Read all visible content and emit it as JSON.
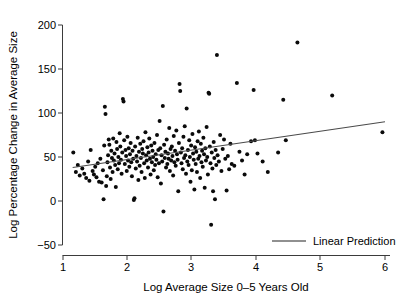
{
  "chart_data": {
    "type": "scatter",
    "title": "",
    "xlabel": "Log Average Size 0–5 Years Old",
    "ylabel": "Log Percentage Change in Average Size",
    "xlim": [
      1.0,
      6.0
    ],
    "ylim": [
      -50,
      200
    ],
    "xticks": [
      1,
      2,
      3,
      4,
      5,
      6
    ],
    "xticklabels": [
      "1",
      "2",
      "3",
      "4",
      "5",
      "6"
    ],
    "yticks": [
      -50,
      0,
      50,
      100,
      150,
      200
    ],
    "yticklabels": [
      "−50",
      "0",
      "50",
      "100",
      "150",
      "200"
    ],
    "grid": false,
    "legend": {
      "position": "bottom-right",
      "entries": [
        {
          "label": "Linear Prediction",
          "type": "line",
          "color": "#6b6b6b"
        }
      ]
    },
    "series": [
      {
        "name": "Observations",
        "type": "scatter",
        "marker": "filled-circle",
        "color": "#0a0a0a",
        "points": [
          [
            1.16,
            55
          ],
          [
            1.2,
            33
          ],
          [
            1.23,
            41
          ],
          [
            1.26,
            29
          ],
          [
            1.3,
            37
          ],
          [
            1.33,
            31
          ],
          [
            1.36,
            26
          ],
          [
            1.39,
            45
          ],
          [
            1.41,
            23
          ],
          [
            1.43,
            58
          ],
          [
            1.46,
            34
          ],
          [
            1.48,
            30
          ],
          [
            1.5,
            39
          ],
          [
            1.52,
            27
          ],
          [
            1.54,
            43
          ],
          [
            1.56,
            22
          ],
          [
            1.58,
            48
          ],
          [
            1.6,
            21
          ],
          [
            1.62,
            35
          ],
          [
            1.63,
            2
          ],
          [
            1.64,
            63
          ],
          [
            1.65,
            107
          ],
          [
            1.66,
            99
          ],
          [
            1.67,
            17
          ],
          [
            1.68,
            28
          ],
          [
            1.69,
            44
          ],
          [
            1.7,
            52
          ],
          [
            1.71,
            70
          ],
          [
            1.72,
            64
          ],
          [
            1.73,
            38
          ],
          [
            1.74,
            25
          ],
          [
            1.75,
            57
          ],
          [
            1.76,
            49
          ],
          [
            1.77,
            33
          ],
          [
            1.78,
            71
          ],
          [
            1.79,
            46
          ],
          [
            1.8,
            54
          ],
          [
            1.81,
            41
          ],
          [
            1.82,
            16
          ],
          [
            1.83,
            67
          ],
          [
            1.84,
            59
          ],
          [
            1.85,
            36
          ],
          [
            1.86,
            50
          ],
          [
            1.87,
            43
          ],
          [
            1.88,
            77
          ],
          [
            1.89,
            62
          ],
          [
            1.9,
            47
          ],
          [
            1.91,
            31
          ],
          [
            1.92,
            55
          ],
          [
            1.93,
            116
          ],
          [
            1.94,
            113
          ],
          [
            1.95,
            69
          ],
          [
            1.96,
            42
          ],
          [
            1.97,
            58
          ],
          [
            1.98,
            51
          ],
          [
            1.99,
            34
          ],
          [
            2.0,
            73
          ],
          [
            2.01,
            46
          ],
          [
            2.02,
            60
          ],
          [
            2.03,
            39
          ],
          [
            2.04,
            53
          ],
          [
            2.05,
            66
          ],
          [
            2.06,
            44
          ],
          [
            2.07,
            28
          ],
          [
            2.08,
            57
          ],
          [
            2.09,
            48
          ],
          [
            2.1,
            1
          ],
          [
            2.11,
            3
          ],
          [
            2.12,
            62
          ],
          [
            2.13,
            37
          ],
          [
            2.14,
            51
          ],
          [
            2.15,
            45
          ],
          [
            2.16,
            72
          ],
          [
            2.17,
            24
          ],
          [
            2.18,
            56
          ],
          [
            2.19,
            40
          ],
          [
            2.2,
            65
          ],
          [
            2.21,
            49
          ],
          [
            2.22,
            33
          ],
          [
            2.23,
            59
          ],
          [
            2.24,
            54
          ],
          [
            2.25,
            68
          ],
          [
            2.26,
            43
          ],
          [
            2.27,
            26
          ],
          [
            2.28,
            78
          ],
          [
            2.29,
            52
          ],
          [
            2.3,
            46
          ],
          [
            2.31,
            61
          ],
          [
            2.32,
            38
          ],
          [
            2.33,
            55
          ],
          [
            2.34,
            71
          ],
          [
            2.35,
            48
          ],
          [
            2.36,
            30
          ],
          [
            2.37,
            63
          ],
          [
            2.38,
            44
          ],
          [
            2.39,
            57
          ],
          [
            2.4,
            50
          ],
          [
            2.41,
            35
          ],
          [
            2.42,
            66
          ],
          [
            2.43,
            41
          ],
          [
            2.44,
            53
          ],
          [
            2.45,
            47
          ],
          [
            2.46,
            75
          ],
          [
            2.47,
            27
          ],
          [
            2.48,
            58
          ],
          [
            2.49,
            43
          ],
          [
            2.5,
            91
          ],
          [
            2.51,
            60
          ],
          [
            2.52,
            20
          ],
          [
            2.53,
            52
          ],
          [
            2.54,
            45
          ],
          [
            2.55,
            108
          ],
          [
            2.56,
            -12
          ],
          [
            2.57,
            64
          ],
          [
            2.58,
            49
          ],
          [
            2.59,
            56
          ],
          [
            2.6,
            38
          ],
          [
            2.61,
            70
          ],
          [
            2.62,
            42
          ],
          [
            2.63,
            54
          ],
          [
            2.64,
            48
          ],
          [
            2.65,
            83
          ],
          [
            2.66,
            34
          ],
          [
            2.67,
            59
          ],
          [
            2.68,
            46
          ],
          [
            2.69,
            62
          ],
          [
            2.7,
            51
          ],
          [
            2.71,
            29
          ],
          [
            2.72,
            74
          ],
          [
            2.73,
            44
          ],
          [
            2.74,
            57
          ],
          [
            2.75,
            40
          ],
          [
            2.76,
            80
          ],
          [
            2.77,
            53
          ],
          [
            2.78,
            47
          ],
          [
            2.79,
            11
          ],
          [
            2.8,
            66
          ],
          [
            2.81,
            133
          ],
          [
            2.82,
            125
          ],
          [
            2.83,
            55
          ],
          [
            2.84,
            43
          ],
          [
            2.85,
            60
          ],
          [
            2.86,
            36
          ],
          [
            2.87,
            73
          ],
          [
            2.88,
            49
          ],
          [
            2.89,
            85
          ],
          [
            2.9,
            52
          ],
          [
            2.91,
            31
          ],
          [
            2.92,
            105
          ],
          [
            2.93,
            45
          ],
          [
            2.94,
            58
          ],
          [
            2.95,
            41
          ],
          [
            2.96,
            69
          ],
          [
            2.97,
            50
          ],
          [
            2.98,
            22
          ],
          [
            2.99,
            63
          ],
          [
            3.0,
            35
          ],
          [
            3.01,
            76
          ],
          [
            3.02,
            54
          ],
          [
            3.03,
            47
          ],
          [
            3.04,
            13
          ],
          [
            3.05,
            61
          ],
          [
            3.06,
            42
          ],
          [
            3.07,
            56
          ],
          [
            3.08,
            33
          ],
          [
            3.09,
            68
          ],
          [
            3.1,
            48
          ],
          [
            3.11,
            79
          ],
          [
            3.12,
            51
          ],
          [
            3.13,
            26
          ],
          [
            3.14,
            65
          ],
          [
            3.15,
            44
          ],
          [
            3.16,
            57
          ],
          [
            3.17,
            39
          ],
          [
            3.18,
            72
          ],
          [
            3.19,
            53
          ],
          [
            3.2,
            15
          ],
          [
            3.21,
            60
          ],
          [
            3.22,
            46
          ],
          [
            3.23,
            84
          ],
          [
            3.24,
            50
          ],
          [
            3.25,
            30
          ],
          [
            3.26,
            123
          ],
          [
            3.27,
            122
          ],
          [
            3.28,
            62
          ],
          [
            3.29,
            43
          ],
          [
            3.3,
            -27
          ],
          [
            3.31,
            55
          ],
          [
            3.32,
            37
          ],
          [
            3.33,
            11
          ],
          [
            3.34,
            67
          ],
          [
            3.35,
            49
          ],
          [
            3.36,
            2
          ],
          [
            3.37,
            58
          ],
          [
            3.38,
            41
          ],
          [
            3.39,
            166
          ],
          [
            3.4,
            52
          ],
          [
            3.42,
            45
          ],
          [
            3.44,
            75
          ],
          [
            3.46,
            34
          ],
          [
            3.48,
            59
          ],
          [
            3.5,
            70
          ],
          [
            3.52,
            48
          ],
          [
            3.54,
            12
          ],
          [
            3.56,
            51
          ],
          [
            3.58,
            36
          ],
          [
            3.6,
            65
          ],
          [
            3.62,
            42
          ],
          [
            3.66,
            40
          ],
          [
            3.7,
            134
          ],
          [
            3.74,
            56
          ],
          [
            3.78,
            46
          ],
          [
            3.82,
            30
          ],
          [
            3.86,
            53
          ],
          [
            3.92,
            68
          ],
          [
            3.96,
            126
          ],
          [
            3.98,
            69
          ],
          [
            4.02,
            54
          ],
          [
            4.1,
            45
          ],
          [
            4.18,
            33
          ],
          [
            4.34,
            55
          ],
          [
            4.42,
            115
          ],
          [
            4.46,
            69
          ],
          [
            4.64,
            180
          ],
          [
            5.18,
            120
          ],
          [
            5.96,
            78
          ]
        ]
      },
      {
        "name": "Linear Prediction",
        "type": "line",
        "color": "#4a4a4a",
        "x": [
          1.15,
          6.0
        ],
        "y": [
          38,
          90
        ]
      }
    ]
  }
}
